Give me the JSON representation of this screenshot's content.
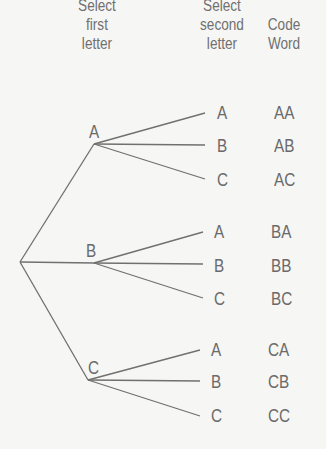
{
  "headers": {
    "first": [
      "Select",
      "first",
      "letter"
    ],
    "second": [
      "Select",
      "second",
      "letter"
    ],
    "code": [
      "Code",
      "Word"
    ]
  },
  "tree": {
    "first_level": [
      "A",
      "B",
      "C"
    ],
    "second_level": [
      "A",
      "B",
      "C"
    ],
    "code_words": [
      [
        "AA",
        "AB",
        "AC"
      ],
      [
        "BA",
        "BB",
        "BC"
      ],
      [
        "CA",
        "CB",
        "CC"
      ]
    ]
  },
  "colors": {
    "line": "#707070",
    "text": "#6a6a6a",
    "background": "#f6f6f4"
  }
}
